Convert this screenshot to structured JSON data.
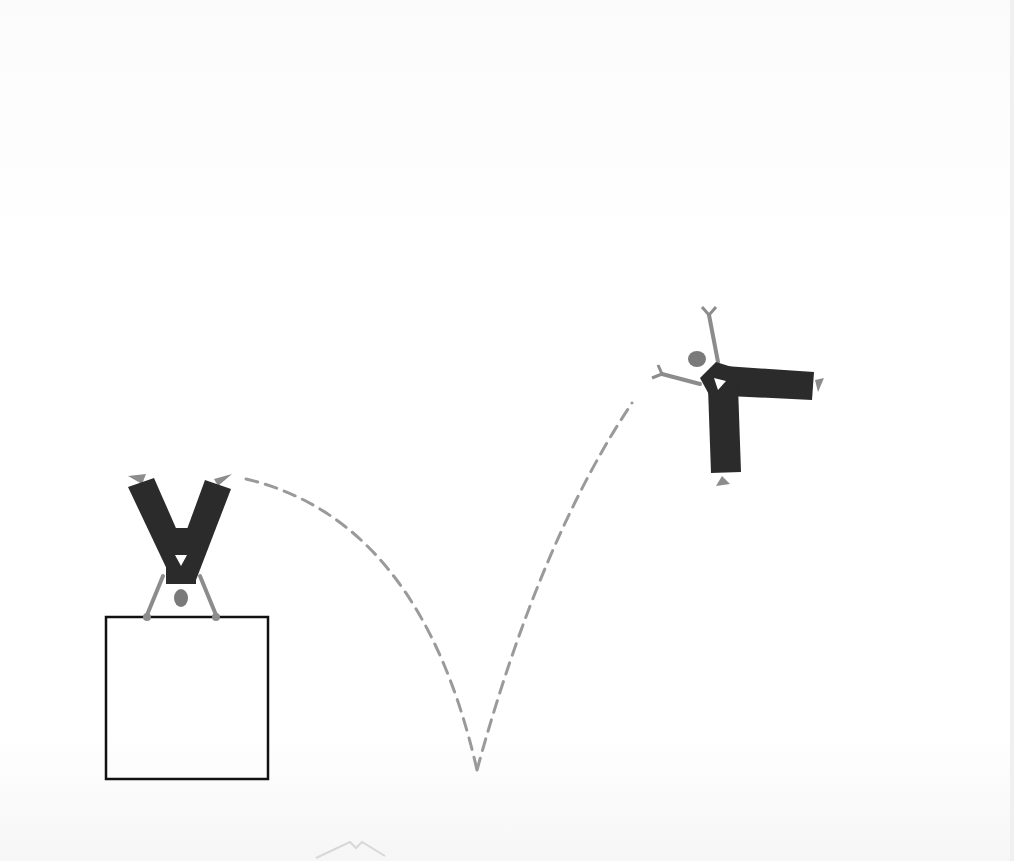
{
  "illustration": {
    "subject": "handstand figure on box flipping through a bouncing arc",
    "colors": {
      "background": "#ffffff",
      "body_dark": "#2b2b2b",
      "limb_gray": "#8c8c8c",
      "head_gray": "#7a7a7a",
      "dash_gray": "#9a9a9a",
      "box_outline": "#111111"
    },
    "elements": {
      "box": {
        "x": 106,
        "y": 617,
        "width": 162,
        "height": 162
      },
      "figure_start": {
        "pose": "handstand",
        "position": [
          180,
          540
        ]
      },
      "figure_end": {
        "pose": "mid-air split",
        "position": [
          735,
          400
        ]
      },
      "trajectory": {
        "style": "dashed",
        "bounce_point": [
          477,
          770
        ]
      }
    }
  }
}
